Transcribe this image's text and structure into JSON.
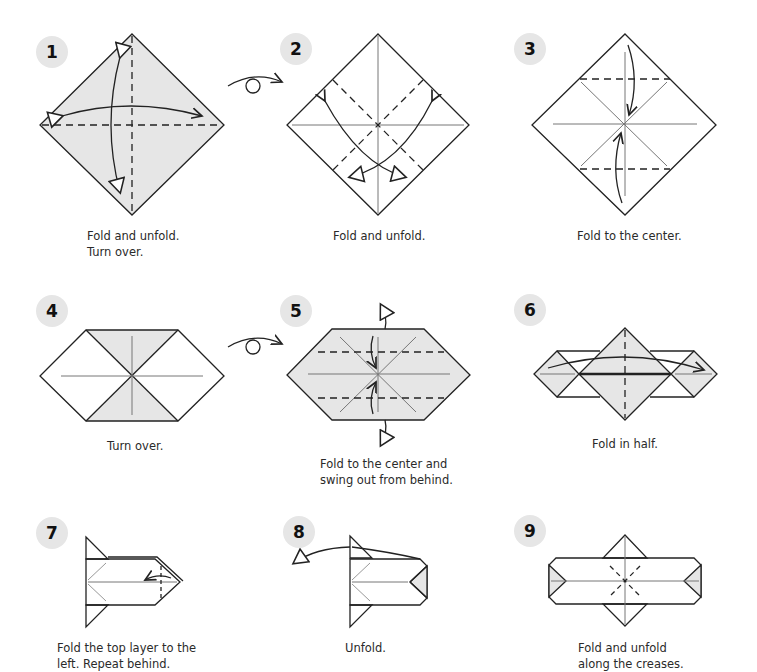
{
  "steps": [
    {
      "number": "1",
      "caption": "Fold and unfold.\nTurn over."
    },
    {
      "number": "2",
      "caption": "Fold and unfold."
    },
    {
      "number": "3",
      "caption": "Fold to the center."
    },
    {
      "number": "4",
      "caption": "Turn over."
    },
    {
      "number": "5",
      "caption": "Fold to the center and\nswing out from behind."
    },
    {
      "number": "6",
      "caption": "Fold in half."
    },
    {
      "number": "7",
      "caption": "Fold the top layer to the\nleft. Repeat behind."
    },
    {
      "number": "8",
      "caption": "Unfold."
    },
    {
      "number": "9",
      "caption": "Fold and unfold\nalong the creases."
    }
  ],
  "symbols": {
    "turn_over_icon": "turn-over-symbol",
    "paper_shade": "#e6e6e6",
    "line_color": "#222222"
  }
}
